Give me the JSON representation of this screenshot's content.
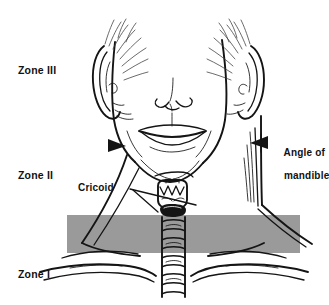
{
  "figure": {
    "name": "neck-zones-anatomical-diagram",
    "background_color": "#ffffff",
    "ink_color": "#111111",
    "band_color": "#9a9a9a"
  },
  "zone_labels": [
    {
      "id": "zone-3",
      "text": "Zone III"
    },
    {
      "id": "zone-2",
      "text": "Zone II"
    },
    {
      "id": "zone-1",
      "text": "Zone I"
    }
  ],
  "callouts": [
    {
      "id": "cricoid",
      "text": "Cricoid",
      "pointer": "leader-line-right"
    },
    {
      "id": "angle-of-mandible",
      "line1": "Angle of",
      "line2": "mandible",
      "pointer": "arrowhead-left"
    }
  ],
  "markers": [
    {
      "id": "mandible-arrow-left",
      "shape": "triangle-right"
    },
    {
      "id": "mandible-arrow-right",
      "shape": "triangle-left"
    }
  ],
  "shaded_band": {
    "label": "gray boundary band",
    "color": "#9a9a9a",
    "x": 67,
    "y": 215,
    "width": 233,
    "height": 38
  }
}
